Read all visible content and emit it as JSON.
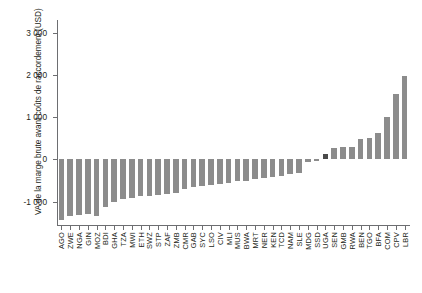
{
  "chart_data": {
    "type": "bar",
    "title": "",
    "subtitle": "",
    "xlabel": "",
    "ylabel": "VA de la marge brute avant coûts de raccordement (USD)",
    "ylim": [
      -1550,
      3300
    ],
    "ytick_values": [
      -1000,
      0,
      1000,
      2000,
      3000
    ],
    "ytick_labels": [
      "-1 000",
      "0",
      "1 000",
      "2 000",
      "3 000"
    ],
    "grid": false,
    "legend": null,
    "annotations": [],
    "bar_color": "#8c8c8c",
    "highlight_color": "#4a4a4a",
    "highlighted_categories": [
      "UGA"
    ],
    "categories": [
      "AGO",
      "ZWE",
      "NGA",
      "GIN",
      "MOZ",
      "BDI",
      "GHA",
      "TZA",
      "MWI",
      "ETH",
      "SWZ",
      "STP",
      "ZAF",
      "ZMB",
      "CMR",
      "GAB",
      "SYC",
      "LSO",
      "CIV",
      "MLI",
      "MUS",
      "BWA",
      "MRT",
      "NER",
      "KEN",
      "TCD",
      "NAM",
      "SLE",
      "MDG",
      "SSD",
      "UGA",
      "SEN",
      "GMB",
      "RWA",
      "BEN",
      "TGO",
      "BFA",
      "COM",
      "CPV",
      "LBR"
    ],
    "values": [
      -1440,
      -1330,
      -1320,
      -1300,
      -1330,
      -1130,
      -1000,
      -940,
      -900,
      -870,
      -860,
      -840,
      -820,
      -790,
      -700,
      -660,
      -620,
      -600,
      -580,
      -560,
      -520,
      -500,
      -470,
      -440,
      -420,
      -380,
      -350,
      -310,
      -60,
      -40,
      130,
      270,
      290,
      300,
      480,
      500,
      620,
      1000,
      1550,
      1980
    ]
  }
}
